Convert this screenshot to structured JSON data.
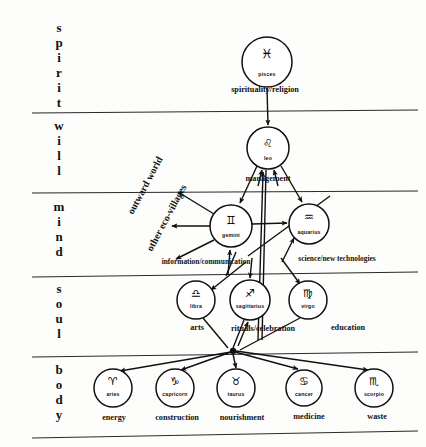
{
  "diagram": {
    "levels": [
      {
        "id": "spirit",
        "label": "spirit",
        "letters": [
          "s",
          "p",
          "i",
          "r",
          "i",
          "t"
        ]
      },
      {
        "id": "will",
        "label": "will",
        "letters": [
          "w",
          "i",
          "l",
          "l"
        ]
      },
      {
        "id": "mind",
        "label": "mind",
        "letters": [
          "m",
          "i",
          "n",
          "d"
        ]
      },
      {
        "id": "soul",
        "label": "soul",
        "letters": [
          "s",
          "o",
          "u",
          "l"
        ]
      },
      {
        "id": "body",
        "label": "body",
        "letters": [
          "b",
          "o",
          "d",
          "y"
        ]
      }
    ],
    "nodes": [
      {
        "id": "pisces",
        "sign": "pisces",
        "glyph": "♓",
        "function": "spirituality/religion",
        "level": "spirit",
        "cx": 267,
        "cy": 62,
        "r": 25
      },
      {
        "id": "leo",
        "sign": "leo",
        "glyph": "♌",
        "function": "management",
        "level": "will",
        "cx": 268,
        "cy": 148,
        "r": 21
      },
      {
        "id": "gemini",
        "sign": "gemini",
        "glyph": "♊",
        "function": "information/communication",
        "level": "mind",
        "cx": 231,
        "cy": 226,
        "r": 21
      },
      {
        "id": "aquarius",
        "sign": "aquarius",
        "glyph": "♒",
        "function": "science/new technologies",
        "level": "mind",
        "cx": 309,
        "cy": 224,
        "r": 20
      },
      {
        "id": "libra",
        "sign": "libra",
        "glyph": "♎",
        "function": "arts",
        "level": "soul",
        "cx": 196,
        "cy": 300,
        "r": 19
      },
      {
        "id": "sagittarius",
        "sign": "sagittarius",
        "glyph": "♐",
        "function": "rituals/celebration",
        "level": "soul",
        "cx": 250,
        "cy": 300,
        "r": 20
      },
      {
        "id": "virgo",
        "sign": "virgo",
        "glyph": "♍",
        "function": "education",
        "level": "soul",
        "cx": 308,
        "cy": 300,
        "r": 19
      },
      {
        "id": "aries",
        "sign": "aries",
        "glyph": "♈",
        "function": "energy",
        "level": "body",
        "cx": 113,
        "cy": 388,
        "r": 19
      },
      {
        "id": "capricorn",
        "sign": "capricorn",
        "glyph": "♑",
        "function": "construction",
        "level": "body",
        "cx": 175,
        "cy": 388,
        "r": 19
      },
      {
        "id": "taurus",
        "sign": "taurus",
        "glyph": "♉",
        "function": "nourishment",
        "level": "body",
        "cx": 236,
        "cy": 388,
        "r": 19
      },
      {
        "id": "cancer",
        "sign": "cancer",
        "glyph": "♋",
        "function": "medicine",
        "level": "body",
        "cx": 304,
        "cy": 388,
        "r": 18
      },
      {
        "id": "scorpio",
        "sign": "scorpio",
        "glyph": "♏",
        "function": "waste",
        "level": "body",
        "cx": 374,
        "cy": 388,
        "r": 19
      }
    ],
    "external_labels": [
      {
        "id": "outward-world",
        "text": "outward world",
        "x": 133,
        "y": 215,
        "rotate": -62
      },
      {
        "id": "other-eco-villages",
        "text": "other eco-villages",
        "x": 152,
        "y": 250,
        "rotate": -62
      }
    ]
  }
}
